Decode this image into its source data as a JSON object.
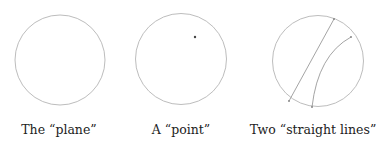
{
  "panels": [
    {
      "label": "The “plane”"
    },
    {
      "label": "A “point”"
    },
    {
      "label": "Two “straight lines”"
    }
  ],
  "colors": {
    "stroke": "#b5b5b5",
    "point": "#444444",
    "text": "#222222"
  }
}
